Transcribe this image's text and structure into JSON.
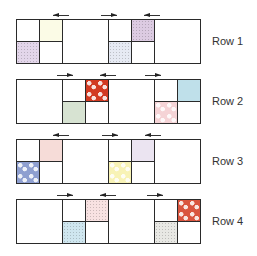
{
  "diagram": {
    "type": "quilt-row-assembly",
    "unit_px": 23,
    "rows": [
      {
        "label": "Row 1",
        "top": 19,
        "arrows": [
          {
            "direction": "left",
            "x": 53,
            "y": 13
          },
          {
            "direction": "right",
            "x": 101,
            "y": 13
          },
          {
            "direction": "left",
            "x": 144,
            "y": 13
          }
        ],
        "cells": [
          {
            "kind": "small",
            "x": 0,
            "y": 0,
            "fill": "#ffffff",
            "pattern": "none"
          },
          {
            "kind": "small",
            "x": 23,
            "y": 0,
            "fill": "#fbfbe6",
            "pattern": "none"
          },
          {
            "kind": "small",
            "x": 0,
            "y": 22,
            "fill": "#e3d6ea",
            "pattern": "speckle"
          },
          {
            "kind": "small",
            "x": 23,
            "y": 22,
            "fill": "#ffffff",
            "pattern": "none"
          },
          {
            "kind": "big",
            "x": 46,
            "y": 0,
            "fill": "#ffffff",
            "pattern": "none"
          },
          {
            "kind": "small",
            "x": 92,
            "y": 0,
            "fill": "#ffffff",
            "pattern": "none"
          },
          {
            "kind": "small",
            "x": 115,
            "y": 0,
            "fill": "#dccbe2",
            "pattern": "speckle"
          },
          {
            "kind": "small",
            "x": 92,
            "y": 22,
            "fill": "#e6eaf3",
            "pattern": "speckle"
          },
          {
            "kind": "small",
            "x": 115,
            "y": 22,
            "fill": "#ffffff",
            "pattern": "none"
          },
          {
            "kind": "big",
            "x": 138,
            "y": 0,
            "fill": "#ffffff",
            "pattern": "none"
          }
        ]
      },
      {
        "label": "Row 2",
        "top": 79,
        "arrows": [
          {
            "direction": "right",
            "x": 57,
            "y": 73
          },
          {
            "direction": "left",
            "x": 100,
            "y": 73
          },
          {
            "direction": "right",
            "x": 145,
            "y": 73
          }
        ],
        "cells": [
          {
            "kind": "big",
            "x": 0,
            "y": 0,
            "fill": "#ffffff",
            "pattern": "none"
          },
          {
            "kind": "small",
            "x": 46,
            "y": 0,
            "fill": "#ffffff",
            "pattern": "none"
          },
          {
            "kind": "small",
            "x": 69,
            "y": 0,
            "fill": "#d23a22",
            "pattern": "flower"
          },
          {
            "kind": "small",
            "x": 46,
            "y": 22,
            "fill": "#d7e3d2",
            "pattern": "none"
          },
          {
            "kind": "small",
            "x": 69,
            "y": 22,
            "fill": "#ffffff",
            "pattern": "none"
          },
          {
            "kind": "big",
            "x": 92,
            "y": 0,
            "fill": "#ffffff",
            "pattern": "none"
          },
          {
            "kind": "small",
            "x": 138,
            "y": 0,
            "fill": "#ffffff",
            "pattern": "none"
          },
          {
            "kind": "small",
            "x": 161,
            "y": 0,
            "fill": "#bfe0ea",
            "pattern": "none"
          },
          {
            "kind": "small",
            "x": 138,
            "y": 22,
            "fill": "#f5d3d6",
            "pattern": "flower"
          },
          {
            "kind": "small",
            "x": 161,
            "y": 22,
            "fill": "#ffffff",
            "pattern": "none"
          }
        ]
      },
      {
        "label": "Row 3",
        "top": 139,
        "arrows": [
          {
            "direction": "left",
            "x": 53,
            "y": 133
          },
          {
            "direction": "right",
            "x": 102,
            "y": 133
          },
          {
            "direction": "left",
            "x": 145,
            "y": 133
          }
        ],
        "cells": [
          {
            "kind": "small",
            "x": 0,
            "y": 0,
            "fill": "#ffffff",
            "pattern": "none"
          },
          {
            "kind": "small",
            "x": 23,
            "y": 0,
            "fill": "#f6dcd8",
            "pattern": "none"
          },
          {
            "kind": "small",
            "x": 0,
            "y": 22,
            "fill": "#8e9fd0",
            "pattern": "flower"
          },
          {
            "kind": "small",
            "x": 23,
            "y": 22,
            "fill": "#ffffff",
            "pattern": "none"
          },
          {
            "kind": "big",
            "x": 46,
            "y": 0,
            "fill": "#ffffff",
            "pattern": "none"
          },
          {
            "kind": "small",
            "x": 92,
            "y": 0,
            "fill": "#ffffff",
            "pattern": "none"
          },
          {
            "kind": "small",
            "x": 115,
            "y": 0,
            "fill": "#ebe4f1",
            "pattern": "none"
          },
          {
            "kind": "small",
            "x": 92,
            "y": 22,
            "fill": "#f8f3b6",
            "pattern": "flower"
          },
          {
            "kind": "small",
            "x": 115,
            "y": 22,
            "fill": "#ffffff",
            "pattern": "none"
          },
          {
            "kind": "big",
            "x": 138,
            "y": 0,
            "fill": "#ffffff",
            "pattern": "none"
          }
        ]
      },
      {
        "label": "Row 4",
        "top": 199,
        "arrows": [
          {
            "direction": "right",
            "x": 57,
            "y": 193
          },
          {
            "direction": "left",
            "x": 100,
            "y": 193
          },
          {
            "direction": "right",
            "x": 147,
            "y": 193
          }
        ],
        "cells": [
          {
            "kind": "big",
            "x": 0,
            "y": 0,
            "fill": "#ffffff",
            "pattern": "none"
          },
          {
            "kind": "small",
            "x": 46,
            "y": 0,
            "fill": "#ffffff",
            "pattern": "none"
          },
          {
            "kind": "small",
            "x": 69,
            "y": 0,
            "fill": "#f8e2e2",
            "pattern": "speckle"
          },
          {
            "kind": "small",
            "x": 46,
            "y": 22,
            "fill": "#cfe6ef",
            "pattern": "speckle"
          },
          {
            "kind": "small",
            "x": 69,
            "y": 22,
            "fill": "#ffffff",
            "pattern": "none"
          },
          {
            "kind": "big",
            "x": 92,
            "y": 0,
            "fill": "#ffffff",
            "pattern": "none"
          },
          {
            "kind": "small",
            "x": 138,
            "y": 0,
            "fill": "#ffffff",
            "pattern": "none"
          },
          {
            "kind": "small",
            "x": 161,
            "y": 0,
            "fill": "#d9553f",
            "pattern": "flower"
          },
          {
            "kind": "small",
            "x": 138,
            "y": 22,
            "fill": "#e8e8e4",
            "pattern": "speckle"
          },
          {
            "kind": "small",
            "x": 161,
            "y": 22,
            "fill": "#ffffff",
            "pattern": "none"
          }
        ]
      }
    ]
  }
}
